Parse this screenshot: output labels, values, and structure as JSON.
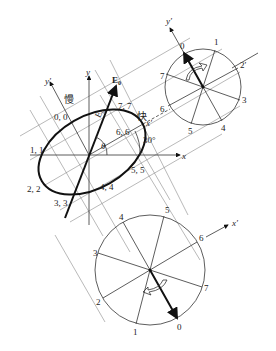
{
  "figure": {
    "labels": {
      "slow": "慢",
      "fast": "快",
      "x": "x",
      "y": "y",
      "x_prime": "x′",
      "y_prime": "y′",
      "e0": "E",
      "e0_sub": "0",
      "theta": "θ",
      "angle_30": "30°",
      "e_small": "E₀"
    },
    "ellipse_points": [
      {
        "id": "p00",
        "text": "0, 0"
      },
      {
        "id": "p11",
        "text": "1, 1"
      },
      {
        "id": "p22",
        "text": "2, 2"
      },
      {
        "id": "p33",
        "text": "3, 3"
      },
      {
        "id": "p44",
        "text": "4, 4"
      },
      {
        "id": "p55",
        "text": "5, 5"
      },
      {
        "id": "p66",
        "text": "6, 6"
      },
      {
        "id": "p77",
        "text": "7, 7"
      }
    ],
    "top_circle": {
      "axis_label": "y′",
      "points": [
        "0",
        "1",
        "2′",
        "3",
        "4",
        "5",
        "6",
        "7"
      ]
    },
    "bottom_circle": {
      "axis_label": "x′",
      "points": [
        "0",
        "1",
        "2",
        "3",
        "4",
        "5",
        "6",
        "7"
      ]
    }
  }
}
